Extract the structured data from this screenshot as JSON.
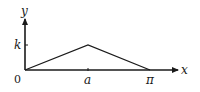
{
  "diagram": {
    "type": "piecewise-linear triangle graph",
    "axes": {
      "x_label": "x",
      "y_label": "y",
      "origin_label": "0"
    },
    "x_ticks": [
      {
        "label": "a",
        "value": "a"
      },
      {
        "label": "π",
        "value": "pi"
      }
    ],
    "y_ticks": [
      {
        "label": "k",
        "value": "k"
      }
    ],
    "polyline": [
      {
        "x": "0",
        "y": "0"
      },
      {
        "x": "a",
        "y": "k"
      },
      {
        "x": "π",
        "y": "0"
      }
    ],
    "colors": {
      "stroke": "#1a1a1a",
      "background": "#ffffff"
    }
  }
}
